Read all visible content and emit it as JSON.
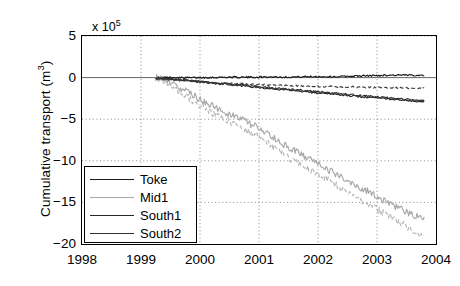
{
  "chart_data": {
    "type": "line",
    "title": "",
    "xlabel": "",
    "ylabel": "Cumulative transport (m",
    "ylabel_sup": "3",
    "ylabel_suffix": ")",
    "exponent_text": "x 10",
    "exponent_sup": "5",
    "y_scale_factor": 100000,
    "xlim": [
      1998,
      2004
    ],
    "ylim": [
      -20,
      5
    ],
    "xticks": [
      1998,
      1999,
      2000,
      2001,
      2002,
      2003,
      2004
    ],
    "yticks": [
      5,
      0,
      -5,
      -10,
      -15,
      -20
    ],
    "grid": true,
    "grid_style": "dotted",
    "legend_position": "lower left",
    "legend": [
      "Toke",
      "Mid1",
      "South1",
      "South2"
    ],
    "colors": {
      "toke": "#1a1a1a",
      "mid1": "#a8a8a8",
      "south1": "#262626",
      "south2": "#333333",
      "grid": "#808080",
      "axis": "#000000"
    },
    "series": [
      {
        "name": "Toke",
        "color": "#1a1a1a",
        "style": "solid",
        "x": [
          1999.25,
          1999.5,
          1999.75,
          2000.0,
          2000.25,
          2000.5,
          2000.75,
          2001.0,
          2001.25,
          2001.5,
          2001.75,
          2002.0,
          2002.25,
          2002.5,
          2002.75,
          2003.0,
          2003.25,
          2003.5,
          2003.8
        ],
        "values": [
          0.0,
          0.02,
          -0.02,
          0.0,
          0.02,
          0.05,
          0.04,
          0.06,
          0.08,
          0.06,
          0.1,
          0.12,
          0.1,
          0.15,
          0.2,
          0.25,
          0.3,
          0.28,
          0.3
        ]
      },
      {
        "name": "Mid1",
        "color": "#a8a8a8",
        "style": "solid",
        "x": [
          1999.25,
          1999.4,
          1999.6,
          1999.8,
          2000.0,
          2000.25,
          2000.5,
          2000.75,
          2001.0,
          2001.25,
          2001.5,
          2001.75,
          2002.0,
          2002.25,
          2002.5,
          2002.75,
          2003.0,
          2003.25,
          2003.5,
          2003.8
        ],
        "values": [
          0.0,
          -0.3,
          -0.9,
          -1.8,
          -2.6,
          -3.6,
          -4.4,
          -5.2,
          -6.1,
          -7.3,
          -8.4,
          -9.4,
          -10.3,
          -11.4,
          -12.4,
          -13.3,
          -14.3,
          -15.2,
          -16.2,
          -17.0
        ]
      },
      {
        "name": "Mid1-secondary",
        "color": "#b5b5b5",
        "style": "dashed",
        "x": [
          1999.3,
          1999.5,
          1999.75,
          2000.0,
          2000.25,
          2000.5,
          2000.75,
          2001.0,
          2001.25,
          2001.5,
          2001.75,
          2002.0,
          2002.25,
          2002.5,
          2002.75,
          2003.0,
          2003.25,
          2003.5,
          2003.8
        ],
        "values": [
          -0.1,
          -0.9,
          -2.2,
          -3.3,
          -4.4,
          -5.3,
          -6.2,
          -7.2,
          -8.4,
          -9.6,
          -10.6,
          -11.6,
          -12.7,
          -13.8,
          -14.8,
          -15.8,
          -16.8,
          -17.9,
          -19.0
        ]
      },
      {
        "name": "South1",
        "color": "#262626",
        "style": "solid",
        "x": [
          1999.25,
          1999.5,
          1999.75,
          2000.0,
          2000.25,
          2000.5,
          2000.75,
          2001.0,
          2001.25,
          2001.5,
          2001.75,
          2002.0,
          2002.25,
          2002.5,
          2002.75,
          2003.0,
          2003.25,
          2003.5,
          2003.8
        ],
        "values": [
          -0.05,
          -0.2,
          -0.35,
          -0.5,
          -0.7,
          -0.85,
          -1.0,
          -1.2,
          -1.35,
          -1.5,
          -1.7,
          -1.85,
          -2.0,
          -2.15,
          -2.3,
          -2.45,
          -2.6,
          -2.75,
          -2.9
        ]
      },
      {
        "name": "South2",
        "color": "#333333",
        "style": "solid",
        "x": [
          1999.25,
          1999.5,
          1999.75,
          2000.0,
          2000.25,
          2000.5,
          2000.75,
          2001.0,
          2001.25,
          2001.5,
          2001.75,
          2002.0,
          2002.25,
          2002.5,
          2002.75,
          2003.0,
          2003.25,
          2003.5,
          2003.8
        ],
        "values": [
          -0.03,
          -0.15,
          -0.3,
          -0.45,
          -0.6,
          -0.75,
          -0.9,
          -1.1,
          -1.25,
          -1.4,
          -1.55,
          -1.7,
          -1.85,
          -2.0,
          -2.15,
          -2.3,
          -2.45,
          -2.6,
          -2.75
        ]
      },
      {
        "name": "South-dashed",
        "color": "#3a3a3a",
        "style": "dashed",
        "x": [
          1999.25,
          1999.5,
          1999.75,
          2000.0,
          2000.25,
          2000.5,
          2000.75,
          2001.0,
          2001.25,
          2001.5,
          2001.75,
          2002.0,
          2002.25,
          2002.5,
          2002.75,
          2003.0,
          2003.25,
          2003.5,
          2003.8
        ],
        "values": [
          -0.1,
          -0.25,
          -0.4,
          -0.5,
          -0.6,
          -0.7,
          -0.75,
          -0.85,
          -0.9,
          -0.95,
          -1.0,
          -1.05,
          -1.1,
          -1.1,
          -1.15,
          -1.2,
          -1.2,
          -1.25,
          -1.3
        ]
      }
    ]
  }
}
